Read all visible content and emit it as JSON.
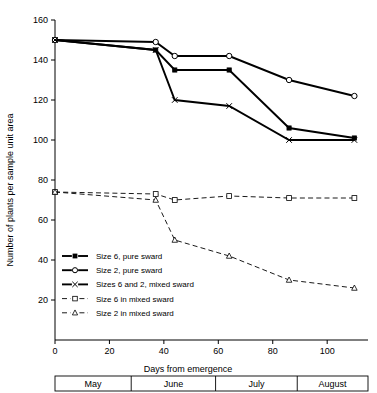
{
  "chart_data": {
    "type": "line",
    "title": "",
    "xlabel": "Days from emergence",
    "ylabel": "Number of plants per sample unit area",
    "xlim": [
      0,
      115
    ],
    "ylim": [
      0,
      160
    ],
    "xticks": [
      0,
      20,
      40,
      60,
      80,
      100
    ],
    "yticks": [
      20,
      40,
      60,
      80,
      100,
      120,
      140,
      160
    ],
    "grid": false,
    "legend_position": "lower-left-inside",
    "x_band_axis": {
      "name": "months",
      "bands": [
        {
          "label": "May",
          "start": 0,
          "end": 28
        },
        {
          "label": "June",
          "start": 28,
          "end": 59
        },
        {
          "label": "July",
          "start": 59,
          "end": 89
        },
        {
          "label": "August",
          "start": 89,
          "end": 115
        }
      ]
    },
    "series": [
      {
        "name": "Size 6, pure sward",
        "marker": "filled-square",
        "line": "solid",
        "x": [
          0,
          37,
          44,
          64,
          86,
          110
        ],
        "values": [
          150,
          145,
          135,
          135,
          106,
          101
        ]
      },
      {
        "name": "Size 2, pure sward",
        "marker": "open-circle",
        "line": "solid",
        "x": [
          0,
          37,
          44,
          64,
          86,
          110
        ],
        "values": [
          150,
          149,
          142,
          142,
          130,
          122
        ]
      },
      {
        "name": "Sizes 6 and 2, mixed sward",
        "marker": "cross",
        "line": "solid",
        "x": [
          0,
          37,
          44,
          64,
          86,
          110
        ],
        "values": [
          150,
          145,
          120,
          117,
          100,
          100
        ]
      },
      {
        "name": "Size 6 in mixed sward",
        "marker": "open-square",
        "line": "dashed",
        "x": [
          0,
          37,
          44,
          64,
          86,
          110
        ],
        "values": [
          74,
          73,
          70,
          72,
          71,
          71
        ]
      },
      {
        "name": "Size 2 in mixed sward",
        "marker": "open-triangle",
        "line": "dashed",
        "x": [
          0,
          37,
          44,
          64,
          86,
          110
        ],
        "values": [
          74,
          70,
          50,
          42,
          30,
          26
        ]
      }
    ],
    "legend": [
      {
        "label": "Size 6, pure sward",
        "marker": "filled-square",
        "line": "solid"
      },
      {
        "label": "Size 2, pure sward",
        "marker": "open-circle",
        "line": "solid"
      },
      {
        "label": "Sizes 6 and 2, mixed sward",
        "marker": "cross",
        "line": "solid"
      },
      {
        "label": "Size 6 in mixed sward",
        "marker": "open-square",
        "line": "dashed"
      },
      {
        "label": "Size 2 in mixed sward",
        "marker": "open-triangle",
        "line": "dashed"
      }
    ]
  },
  "colors": {
    "ink": "#000000",
    "background": "#ffffff"
  }
}
